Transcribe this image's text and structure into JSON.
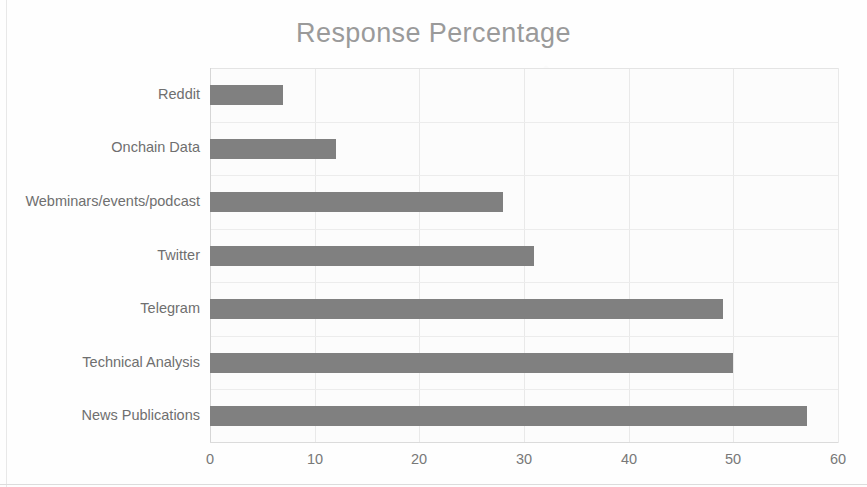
{
  "chart_data": {
    "type": "bar",
    "orientation": "horizontal",
    "title": "Response Percentage",
    "xlabel": "",
    "ylabel": "",
    "categories": [
      "Reddit",
      "Onchain Data",
      "Webminars/events/podcast",
      "Twitter",
      "Telegram",
      "Technical Analysis",
      "News Publications"
    ],
    "values": [
      7,
      12,
      28,
      31,
      49,
      50,
      57
    ],
    "xlim": [
      0,
      60
    ],
    "x_ticks": [
      "0",
      "10",
      "20",
      "30",
      "40",
      "50",
      "60"
    ],
    "x_tick_values": [
      0,
      10,
      20,
      30,
      40,
      50,
      60
    ],
    "grid": true,
    "legend": false,
    "series": [
      {
        "name": "Response Percentage",
        "values": [
          7,
          12,
          28,
          31,
          49,
          50,
          57
        ]
      }
    ]
  },
  "style": {
    "bar_color": "#808080",
    "title_color": "#9a9a9a",
    "tick_label_color": "#787878",
    "category_label_color": "#6f6f6f",
    "gridline_color": "#e9e9e9",
    "plot_background": "#fcfcfc",
    "page_background": "#fefefe"
  }
}
